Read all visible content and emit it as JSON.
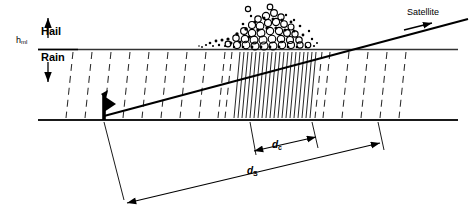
{
  "diagram": {
    "labels": {
      "hml_main": "h",
      "hml_sub": "ml",
      "hail": "Hail",
      "rain": "Rain",
      "satellite": "Satellite",
      "dc_main": "d",
      "dc_sub": "c",
      "ds_main": "d",
      "ds_sub": "S"
    },
    "colors": {
      "ink": "#000000",
      "rain_dash": "#333333",
      "ground": "#1a1a1a"
    },
    "geometry": {
      "melting_layer_y": 49,
      "ground_y": 120,
      "layer_x_start": 38,
      "layer_x_end": 458,
      "antenna_x": 104,
      "beam_start_x": 104,
      "beam_start_y": 116,
      "beam_end_x": 466,
      "beam_end_y": 20,
      "hail_peak_x": 274,
      "hail_left_x": 205,
      "hail_right_x": 318,
      "dc_left_x": 250,
      "dc_right_x": 312,
      "dc_y": 150,
      "ds_left_x": 127,
      "ds_left_y": 202,
      "ds_right_x": 378,
      "ds_right_y": 142
    }
  }
}
